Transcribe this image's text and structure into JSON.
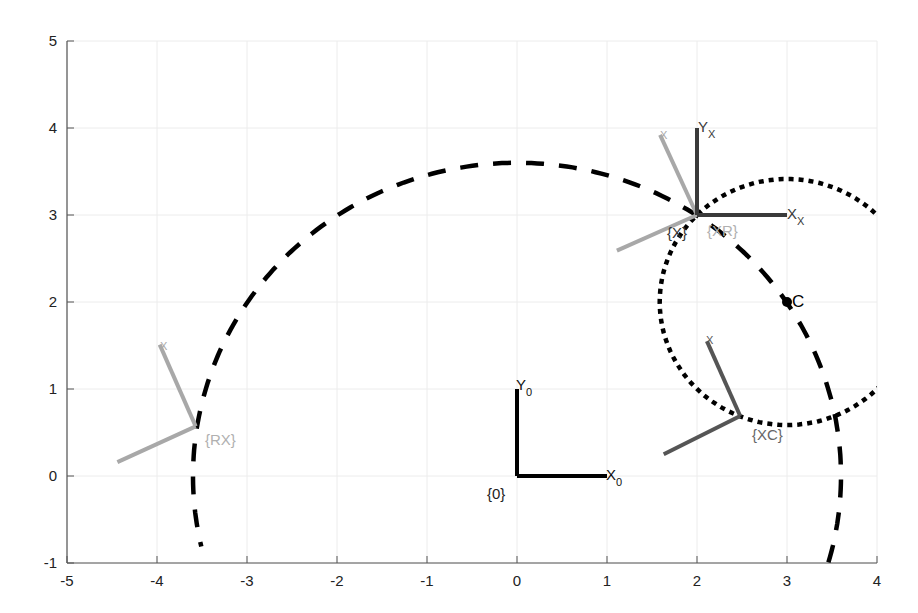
{
  "chart_data": {
    "type": "line",
    "title": "",
    "xlabel": "",
    "ylabel": "",
    "xlim": [
      -5,
      4
    ],
    "ylim": [
      -1,
      5
    ],
    "grid": true,
    "box": false,
    "x_ticks": [
      "-5",
      "-4",
      "-3",
      "-2",
      "-1",
      "0",
      "1",
      "2",
      "3",
      "4"
    ],
    "y_ticks": [
      "-1",
      "0",
      "1",
      "2",
      "3",
      "4",
      "5"
    ],
    "curves": [
      {
        "name": "dashed-arc",
        "style": "dashed",
        "color": "#000000",
        "center": [
          0,
          0
        ],
        "radius": 3.6,
        "angle_start_deg": -16,
        "angle_end_deg": 193
      },
      {
        "name": "dotted-circle",
        "style": "dotted",
        "color": "#000000",
        "center": [
          3,
          2
        ],
        "radius": 1.414,
        "clipped_at_x": 4
      }
    ],
    "points": [
      {
        "label": "C",
        "x": 3,
        "y": 2,
        "color": "#000000"
      }
    ],
    "frames": [
      {
        "name": "{0}",
        "origin": [
          0,
          0
        ],
        "x_end": [
          1,
          0
        ],
        "y_end": [
          0,
          1
        ],
        "x_label": "X",
        "x_sub": "0",
        "y_label": "Y",
        "y_sub": "0",
        "color": "#000000"
      },
      {
        "name": "{X}",
        "origin": [
          2,
          3
        ],
        "x_end": [
          3,
          3
        ],
        "y_end": [
          2,
          4
        ],
        "x_label": "X",
        "x_sub": "X",
        "y_label": "Y",
        "y_sub": "X",
        "color": "#3a3a3a"
      },
      {
        "name": "{XR}",
        "origin": [
          2,
          3
        ],
        "x_end": [
          1.59,
          3.92
        ],
        "y_end": [
          1.11,
          2.59
        ],
        "x_label": "X",
        "y_label": "",
        "color": "#a8a8a8"
      },
      {
        "name": "{RX}",
        "origin": [
          -3.57,
          0.57
        ],
        "x_end": [
          -3.97,
          1.51
        ],
        "y_end": [
          -4.44,
          0.16
        ],
        "x_label": "X",
        "y_label": "",
        "color": "#a8a8a8"
      },
      {
        "name": "{XC}",
        "origin": [
          2.48,
          0.69
        ],
        "x_end": [
          2.11,
          1.55
        ],
        "y_end": [
          1.63,
          0.25
        ],
        "x_label": "X",
        "y_label": "",
        "color": "#555555"
      }
    ],
    "annotations": [
      "{0}",
      "{X}",
      "{XR}",
      "{RX}",
      "{XC}",
      "C",
      "X0",
      "Y0",
      "XX",
      "YX"
    ]
  },
  "labels": {
    "origin_frame": "{0}",
    "x_frame": "{X}",
    "xr_frame": "{XR}",
    "rx_frame": "{RX}",
    "xc_frame": "{XC}",
    "point_c": "C",
    "axis_x": "X",
    "axis_y": "Y",
    "sub_0": "0",
    "sub_x": "X",
    "small_x": "X"
  },
  "colors": {
    "grid": "#ececec",
    "axis": "#555555",
    "dark_frame": "#3a3a3a",
    "light_frame": "#a8a8a8",
    "mid_frame": "#555555"
  }
}
